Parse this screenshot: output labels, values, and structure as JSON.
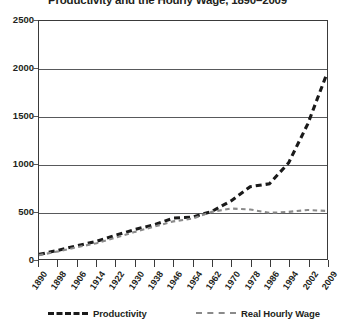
{
  "chart_data": {
    "type": "line",
    "title": "Productivity and the Hourly Wage, 1890–2009",
    "xlabel": "",
    "ylabel": "",
    "ylim": [
      0,
      2500
    ],
    "yticks": [
      0,
      500,
      1000,
      1500,
      2000,
      2500
    ],
    "ytick_labels": [
      "0",
      "500",
      "1000",
      "1500",
      "2000",
      "2500"
    ],
    "grid": true,
    "legend_position": "bottom",
    "categories": [
      "1890",
      "1898",
      "1906",
      "1914",
      "1922",
      "1930",
      "1938",
      "1946",
      "1954",
      "1962",
      "1970",
      "1978",
      "1986",
      "1994",
      "2002",
      "2009"
    ],
    "series": [
      {
        "name": "Productivity",
        "color": "#1a1a1a",
        "style": "dashed-thick",
        "values": [
          48,
          92,
          140,
          185,
          250,
          310,
          360,
          430,
          440,
          500,
          610,
          760,
          790,
          1010,
          1420,
          1950
        ]
      },
      {
        "name": "Real Hourly Wage",
        "color": "#8a8a8a",
        "style": "dashed-thin",
        "values": [
          40,
          80,
          125,
          165,
          225,
          285,
          340,
          395,
          425,
          495,
          530,
          520,
          485,
          495,
          515,
          505
        ]
      }
    ]
  },
  "legend": {
    "items": [
      {
        "label": "Productivity"
      },
      {
        "label": "Real Hourly Wage"
      }
    ]
  },
  "colors": {
    "productivity": "#1a1a1a",
    "wage": "#8a8a8a",
    "axis": "#3a3a3a",
    "grid": "#58595b",
    "text": "#231f20",
    "background": "#ffffff"
  }
}
